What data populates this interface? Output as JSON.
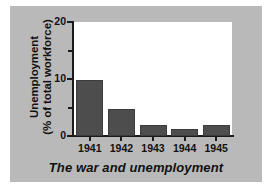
{
  "chart_data": {
    "type": "bar",
    "title": "The war and unemployment",
    "xlabel": "",
    "ylabel": "Unemployment (% of total workforce)",
    "ylabel_line1": "Unemployment",
    "ylabel_line2": "(% of total workforce)",
    "categories": [
      "1941",
      "1942",
      "1943",
      "1944",
      "1945"
    ],
    "values": [
      9.9,
      4.7,
      1.9,
      1.2,
      1.9
    ],
    "ylim": [
      0,
      20
    ],
    "ytick_labels": [
      "0",
      "10",
      "20"
    ],
    "ytick_values": [
      0,
      10,
      20
    ],
    "yminor_ticks": [
      5,
      15
    ],
    "grid": false,
    "legend": false,
    "bar_color": "#4d4d4d",
    "plot_background": "#ffffff",
    "panel_background": "#b9b9b9",
    "axis_color": "#1b1b1b",
    "text_color": "#111111"
  }
}
